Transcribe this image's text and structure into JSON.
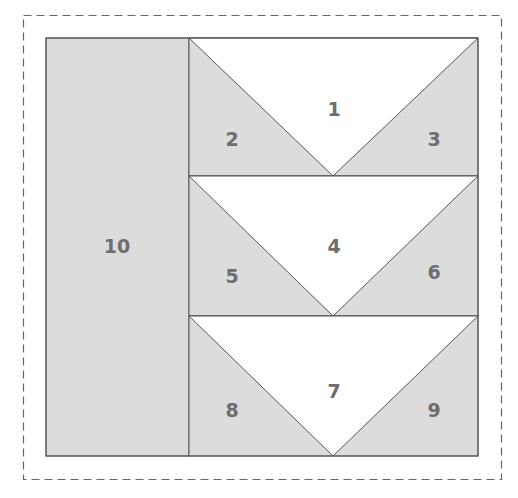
{
  "diagram": {
    "colors": {
      "background": "#ffffff",
      "shaded": "#dcdcdc",
      "unshaded": "#ffffff",
      "line": "#555555",
      "label": "#6e6e6e",
      "dashed_border": "#666666"
    },
    "pieces": [
      {
        "id": "1",
        "label": "1",
        "shade": "white",
        "x": 334,
        "y": 110
      },
      {
        "id": "2",
        "label": "2",
        "shade": "grey",
        "x": 232,
        "y": 140
      },
      {
        "id": "3",
        "label": "3",
        "shade": "grey",
        "x": 434,
        "y": 140
      },
      {
        "id": "4",
        "label": "4",
        "shade": "white",
        "x": 334,
        "y": 247
      },
      {
        "id": "5",
        "label": "5",
        "shade": "grey",
        "x": 232,
        "y": 277
      },
      {
        "id": "6",
        "label": "6",
        "shade": "grey",
        "x": 434,
        "y": 273
      },
      {
        "id": "7",
        "label": "7",
        "shade": "white",
        "x": 334,
        "y": 392
      },
      {
        "id": "8",
        "label": "8",
        "shade": "grey",
        "x": 232,
        "y": 411
      },
      {
        "id": "9",
        "label": "9",
        "shade": "grey",
        "x": 434,
        "y": 411
      },
      {
        "id": "10",
        "label": "10",
        "shade": "grey",
        "x": 117,
        "y": 247
      }
    ]
  }
}
